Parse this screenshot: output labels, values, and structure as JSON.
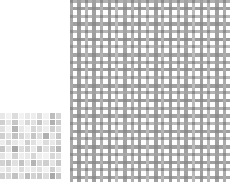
{
  "page": {
    "background_color": "#ffffff",
    "width": 243,
    "height": 194
  },
  "swatches": [
    {
      "name": "small-checker-swatch",
      "label": "Small checkered weave swatch",
      "x": 0,
      "y": 113,
      "width": 62,
      "height": 67,
      "columns": 10,
      "rows": 10,
      "palette": {
        "light": "#f2f2f2",
        "mid_light": "#e0e0e0",
        "mid": "#cccccc",
        "mid_dark": "#b5b5b5",
        "dark": "#9e9e9e",
        "grid_line": "#ffffff"
      },
      "cells": [
        [
          "#e8e8e8",
          "#f2f2f2",
          "#dcdcdc",
          "#f2f2f2",
          "#e8e8e8",
          "#ededed",
          "#dcdcdc",
          "#f2f2f2",
          "#bdbdbd",
          "#d6d6d6"
        ],
        [
          "#cfcfcf",
          "#e4e4e4",
          "#c6c6c6",
          "#ededed",
          "#d6d6d6",
          "#e0e0e0",
          "#c2c2c2",
          "#e8e8e8",
          "#b0b0b0",
          "#c9c9c9"
        ],
        [
          "#e0e0e0",
          "#f2f2f2",
          "#b5b5b5",
          "#e8e8e8",
          "#f2f2f2",
          "#d6d6d6",
          "#e0e0e0",
          "#ededed",
          "#cfcfcf",
          "#dcdcdc"
        ],
        [
          "#cfcfcf",
          "#e0e0e0",
          "#c2c2c2",
          "#d6d6d6",
          "#e4e4e4",
          "#c6c6c6",
          "#dcdcdc",
          "#b0b0b0",
          "#e4e4e4",
          "#c6c6c6"
        ],
        [
          "#ededed",
          "#d6d6d6",
          "#e8e8e8",
          "#f2f2f2",
          "#cfcfcf",
          "#e0e0e0",
          "#f2f2f2",
          "#dcdcdc",
          "#e8e8e8",
          "#d2d2d2"
        ],
        [
          "#c6c6c6",
          "#e4e4e4",
          "#a8a8a8",
          "#dcdcdc",
          "#d2d2d2",
          "#e8e8e8",
          "#c2c2c2",
          "#e0e0e0",
          "#cfcfcf",
          "#b8b8b8"
        ],
        [
          "#e4e4e4",
          "#f2f2f2",
          "#d2d2d2",
          "#ededed",
          "#e8e8e8",
          "#d6d6d6",
          "#ededed",
          "#f2f2f2",
          "#d6d6d6",
          "#e0e0e0"
        ],
        [
          "#d2d2d2",
          "#c9c9c9",
          "#e0e0e0",
          "#c2c2c2",
          "#e4e4e4",
          "#b5b5b5",
          "#d6d6d6",
          "#cfcfcf",
          "#e4e4e4",
          "#c6c6c6"
        ],
        [
          "#ededed",
          "#e0e0e0",
          "#f2f2f2",
          "#dcdcdc",
          "#ededed",
          "#e8e8e8",
          "#e0e0e0",
          "#f2f2f2",
          "#cfcfcf",
          "#e8e8e8"
        ],
        [
          "#cfcfcf",
          "#d6d6d6",
          "#c2c2c2",
          "#e0e0e0",
          "#bdbdbd",
          "#d2d2d2",
          "#c9c9c9",
          "#dcdcdc",
          "#a8a8a8",
          "#c6c6c6"
        ]
      ]
    },
    {
      "name": "large-woven-swatch",
      "label": "Large open woven mesh swatch",
      "x": 70,
      "y": 0,
      "width": 160,
      "height": 182,
      "palette": {
        "thread_dark": "#9a9a9a",
        "thread_mid": "#b4b4b4",
        "thread_light": "#cccccc",
        "thread_pale": "#e2e2e2",
        "gap": "#ffffff",
        "knot": "#8c8c8c"
      },
      "warp_count": 21,
      "weft_count": 24,
      "warp_pitch": 7.6,
      "weft_pitch": 7.6,
      "warps": [
        {
          "x": 0,
          "w": 3.0,
          "color": "#a8a8a8"
        },
        {
          "x": 7,
          "w": 3.6,
          "color": "#9e9e9e"
        },
        {
          "x": 15,
          "w": 3.0,
          "color": "#b4b4b4"
        },
        {
          "x": 22,
          "w": 4.0,
          "color": "#a0a0a0"
        },
        {
          "x": 30,
          "w": 3.0,
          "color": "#b0b0b0"
        },
        {
          "x": 38,
          "w": 3.4,
          "color": "#9a9a9a"
        },
        {
          "x": 45,
          "w": 3.0,
          "color": "#bcbcbc"
        },
        {
          "x": 53,
          "w": 3.8,
          "color": "#a4a4a4"
        },
        {
          "x": 61,
          "w": 3.0,
          "color": "#b0b0b0"
        },
        {
          "x": 68,
          "w": 3.4,
          "color": "#9e9e9e"
        },
        {
          "x": 76,
          "w": 3.0,
          "color": "#b8b8b8"
        },
        {
          "x": 84,
          "w": 3.8,
          "color": "#a0a0a0"
        },
        {
          "x": 91,
          "w": 3.0,
          "color": "#b4b4b4"
        },
        {
          "x": 99,
          "w": 3.4,
          "color": "#9c9c9c"
        },
        {
          "x": 107,
          "w": 3.0,
          "color": "#b0b0b0"
        },
        {
          "x": 114,
          "w": 3.8,
          "color": "#a2a2a2"
        },
        {
          "x": 122,
          "w": 3.0,
          "color": "#bababa"
        },
        {
          "x": 130,
          "w": 3.4,
          "color": "#9e9e9e"
        },
        {
          "x": 137,
          "w": 3.0,
          "color": "#b4b4b4"
        },
        {
          "x": 145,
          "w": 3.8,
          "color": "#a0a0a0"
        },
        {
          "x": 153,
          "w": 3.2,
          "color": "#acacac"
        }
      ],
      "wefts": [
        {
          "y": 0,
          "h": 2.6,
          "color": "#b0b0b0"
        },
        {
          "y": 7,
          "h": 3.4,
          "color": "#9e9e9e"
        },
        {
          "y": 15,
          "h": 2.6,
          "color": "#b8b8b8"
        },
        {
          "y": 22,
          "h": 3.6,
          "color": "#a0a0a0"
        },
        {
          "y": 30,
          "h": 2.6,
          "color": "#b4b4b4"
        },
        {
          "y": 38,
          "h": 3.4,
          "color": "#9a9a9a"
        },
        {
          "y": 45,
          "h": 2.6,
          "color": "#bcbcbc"
        },
        {
          "y": 53,
          "h": 3.6,
          "color": "#a4a4a4"
        },
        {
          "y": 61,
          "h": 2.6,
          "color": "#b0b0b0"
        },
        {
          "y": 68,
          "h": 3.4,
          "color": "#9e9e9e"
        },
        {
          "y": 76,
          "h": 2.6,
          "color": "#b8b8b8"
        },
        {
          "y": 84,
          "h": 3.6,
          "color": "#a0a0a0"
        },
        {
          "y": 91,
          "h": 2.6,
          "color": "#b4b4b4"
        },
        {
          "y": 99,
          "h": 3.4,
          "color": "#9c9c9c"
        },
        {
          "y": 107,
          "h": 2.6,
          "color": "#b0b0b0"
        },
        {
          "y": 114,
          "h": 3.6,
          "color": "#a2a2a2"
        },
        {
          "y": 122,
          "h": 2.6,
          "color": "#bababa"
        },
        {
          "y": 130,
          "h": 3.4,
          "color": "#9e9e9e"
        },
        {
          "y": 137,
          "h": 2.6,
          "color": "#b4b4b4"
        },
        {
          "y": 145,
          "h": 3.6,
          "color": "#a0a0a0"
        },
        {
          "y": 153,
          "h": 2.6,
          "color": "#b0b0b0"
        },
        {
          "y": 161,
          "h": 3.4,
          "color": "#9e9e9e"
        },
        {
          "y": 168,
          "h": 2.6,
          "color": "#b8b8b8"
        },
        {
          "y": 176,
          "h": 3.4,
          "color": "#a4a4a4"
        }
      ]
    }
  ]
}
